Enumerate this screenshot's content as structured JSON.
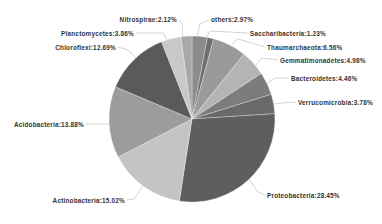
{
  "chart_data": {
    "type": "pie",
    "title": "",
    "start_angle_deg": 0,
    "direction": "clockwise",
    "center": [
      192,
      119
    ],
    "radius": 83,
    "slices": [
      {
        "label": "others",
        "value": 2.97,
        "display": "others:2.97%",
        "color": "#8c8c8c",
        "label_pos": [
          211,
          22
        ],
        "anchor": "start",
        "leader": [
          [
            197,
            37
          ],
          [
            200,
            24
          ],
          [
            209,
            20
          ]
        ]
      },
      {
        "label": "Saccharibacteria",
        "value": 1.23,
        "display": "Saccharibacteria:1.23%",
        "color": "#6e6e6e",
        "label_pos": [
          250,
          36
        ],
        "anchor": "start",
        "leader": [
          [
            206,
            38
          ],
          [
            210,
            31
          ],
          [
            248,
            33
          ]
        ]
      },
      {
        "label": "Thaumarchaeota",
        "value": 6.56,
        "display": "Thaumarchaeota:6.56%",
        "color": "#9a9a9a",
        "label_pos": [
          267,
          50
        ],
        "anchor": "start",
        "leader": [
          [
            232,
            44
          ],
          [
            238,
            39
          ],
          [
            265,
            47
          ]
        ]
      },
      {
        "label": "Gemmatimonadetes",
        "value": 4.98,
        "display": "Gemmatimonadetes:4.98%",
        "color": "#b4b4b4",
        "label_pos": [
          280,
          63
        ],
        "anchor": "start",
        "leader": [
          [
            256,
            65
          ],
          [
            262,
            58
          ],
          [
            278,
            60
          ]
        ]
      },
      {
        "label": "Bacteroidetes",
        "value": 4.46,
        "display": "Bacteroidetes:4.46%",
        "color": "#7c7c7c",
        "label_pos": [
          291,
          81
        ],
        "anchor": "start",
        "leader": [
          [
            268,
            83
          ],
          [
            275,
            78
          ],
          [
            289,
            78
          ]
        ]
      },
      {
        "label": "Verrucomicrobia",
        "value": 3.78,
        "display": "Verrucomicrobia:3.78%",
        "color": "#6a6a6a",
        "label_pos": [
          298,
          105
        ],
        "anchor": "start",
        "leader": [
          [
            274,
            104
          ],
          [
            282,
            103
          ],
          [
            296,
            102
          ]
        ]
      },
      {
        "label": "Proteobacteria",
        "value": 28.45,
        "display": "Proteobacteria:28.45%",
        "color": "#5e5e5e",
        "label_pos": [
          267,
          198
        ],
        "anchor": "start",
        "leader": [
          [
            249,
            179
          ],
          [
            258,
            192
          ],
          [
            265,
            195
          ]
        ]
      },
      {
        "label": "Actinobacteria",
        "value": 15.02,
        "display": "Actinobacteria:15.02%",
        "color": "#c4c4c4",
        "label_pos": [
          125,
          203
        ],
        "anchor": "end",
        "leader": [
          [
            143,
            186
          ],
          [
            134,
            199
          ],
          [
            127,
            200
          ]
        ]
      },
      {
        "label": "Acidobacteria",
        "value": 13.88,
        "display": "Acidobacteria:13.88%",
        "color": "#9c9c9c",
        "label_pos": [
          84,
          127
        ],
        "anchor": "end",
        "leader": [
          [
            109,
            124
          ],
          [
            98,
            124
          ],
          [
            86,
            124
          ]
        ]
      },
      {
        "label": "Chloroflexi",
        "value": 12.69,
        "display": "Chloroflexi:12.69%",
        "color": "#5a5a5a",
        "label_pos": [
          116,
          50
        ],
        "anchor": "end",
        "leader": [
          [
            136,
            58
          ],
          [
            128,
            50
          ],
          [
            118,
            47
          ]
        ]
      },
      {
        "label": "Planctomycetes",
        "value": 3.86,
        "display": "Planctomycetes:3.86%",
        "color": "#c8c8c8",
        "label_pos": [
          134,
          36
        ],
        "anchor": "end",
        "leader": [
          [
            167,
            40
          ],
          [
            163,
            33
          ],
          [
            136,
            33
          ]
        ]
      },
      {
        "label": "Nitrospirae",
        "value": 2.12,
        "display": "Nitrospirae:2.12%",
        "color": "#a8a8a8",
        "label_pos": [
          177,
          22
        ],
        "anchor": "end",
        "leader": [
          [
            183,
            37
          ],
          [
            182,
            24
          ],
          [
            179,
            20
          ]
        ]
      }
    ],
    "legend": "none",
    "grid": false
  }
}
